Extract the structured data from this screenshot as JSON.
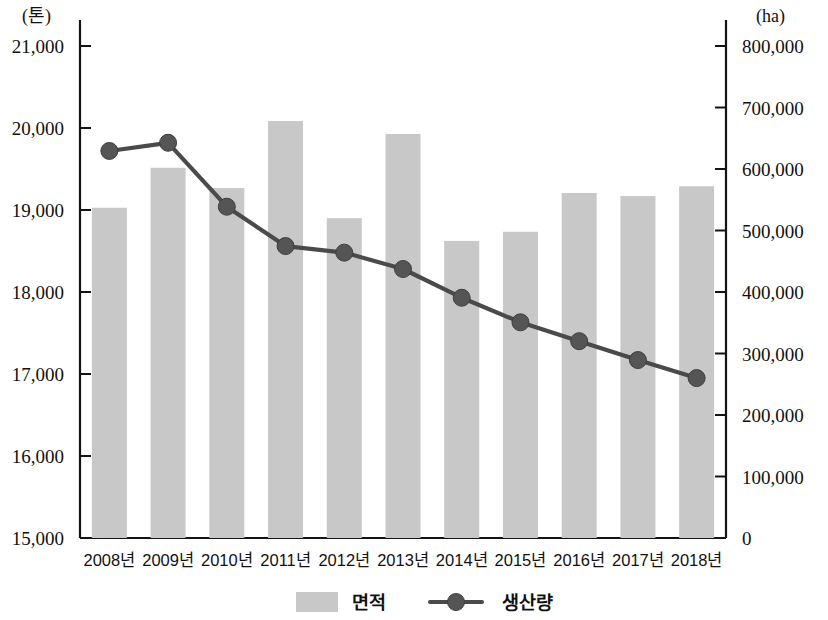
{
  "chart_data": {
    "type": "bar",
    "title": "",
    "subtitle": "",
    "xlabel": "",
    "ylabel": "(톤)",
    "y2label": "(ha)",
    "grid": false,
    "legend_position": "bottom-center",
    "categories": [
      "2008년",
      "2009년",
      "2010년",
      "2011년",
      "2012년",
      "2013년",
      "2014년",
      "2015년",
      "2016년",
      "2017년",
      "2018년"
    ],
    "left_axis": {
      "unit": "(톤)",
      "min": 15000,
      "max": 21000,
      "step": 1000,
      "ticks": [
        21000,
        20000,
        19000,
        18000,
        17000,
        16000,
        15000
      ],
      "tick_labels": [
        "21,000",
        "20,000",
        "19,000",
        "18,000",
        "17,000",
        "16,000",
        "15,000"
      ]
    },
    "right_axis": {
      "unit": "(ha)",
      "min": 0,
      "max": 800000,
      "step": 100000,
      "ticks": [
        800000,
        700000,
        600000,
        500000,
        400000,
        300000,
        200000,
        100000,
        0
      ],
      "tick_labels": [
        "800,000",
        "700,000",
        "600,000",
        "500,000",
        "400,000",
        "300,000",
        "200,000",
        "100,000",
        "0"
      ]
    },
    "series": [
      {
        "name": "면적",
        "type": "bar",
        "axis": "right",
        "unit": "ha",
        "color": "#c8c8c8",
        "values": [
          537000,
          602000,
          569000,
          678000,
          520000,
          657000,
          483000,
          498000,
          561000,
          556000,
          572000
        ]
      },
      {
        "name": "생산량",
        "type": "line",
        "axis": "left",
        "unit": "톤",
        "color": "#4a4a4a",
        "marker": "circle",
        "values": [
          19720,
          19820,
          19040,
          18560,
          18480,
          18280,
          17930,
          17630,
          17400,
          17170,
          16950
        ]
      }
    ]
  },
  "legend": {
    "items": [
      {
        "label": "면적",
        "symbol": "swatch",
        "color": "#c8c8c8"
      },
      {
        "label": "생산량",
        "symbol": "line-marker",
        "color": "#4a4a4a"
      }
    ]
  }
}
